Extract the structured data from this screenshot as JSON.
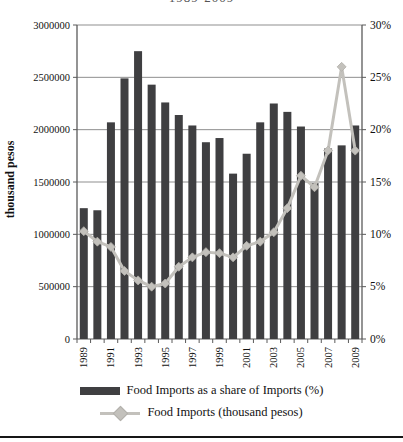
{
  "title_fragment": "1989-2009",
  "colors": {
    "bar": "#3f3f41",
    "line": "#c3c1bc",
    "line_edge": "#b2b0ab",
    "grid": "#8f8f8f",
    "axis": "#5a5a5a",
    "text": "#111111"
  },
  "y_axis_left_title": "thousand pesos",
  "chart_data": {
    "type": "bar",
    "subtype": "bar+line combo, dual axis",
    "categories": [
      1989,
      1990,
      1991,
      1992,
      1993,
      1994,
      1995,
      1996,
      1997,
      1998,
      1999,
      2000,
      2001,
      2002,
      2003,
      2004,
      2005,
      2006,
      2007,
      2008,
      2009
    ],
    "x_tick_labels": [
      "1989",
      "1991",
      "1993",
      "1995",
      "1997",
      "1999",
      "2001",
      "2003",
      "2005",
      "2007",
      "2009"
    ],
    "left_axis": {
      "label": "thousand pesos",
      "min": 0,
      "max": 3000000,
      "step": 500000,
      "tick_labels": [
        "0",
        "500000",
        "1000000",
        "1500000",
        "2000000",
        "2500000",
        "3000000"
      ]
    },
    "right_axis": {
      "min": 0,
      "max": 30,
      "step": 5,
      "tick_labels": [
        "0%",
        "5%",
        "10%",
        "15%",
        "20%",
        "25%",
        "30%"
      ]
    },
    "grid": true,
    "legend_position": "bottom",
    "series": [
      {
        "name": "Food Imports as a share of Imports (%)",
        "type": "bar",
        "axis": "left",
        "values": [
          1250000,
          1230000,
          2070000,
          2490000,
          2750000,
          2430000,
          2260000,
          2140000,
          2040000,
          1880000,
          1920000,
          1580000,
          1770000,
          2070000,
          2250000,
          2170000,
          2030000,
          1490000,
          1820000,
          1850000,
          2040000
        ]
      },
      {
        "name": "Food Imports (thousand pesos)",
        "type": "line",
        "marker": "diamond",
        "axis": "right",
        "values": [
          10.3,
          9.3,
          8.8,
          6.5,
          5.6,
          5.0,
          5.3,
          6.9,
          7.8,
          8.3,
          8.2,
          7.8,
          8.9,
          9.3,
          10.2,
          12.5,
          15.6,
          14.5,
          18.0,
          26.0,
          18.0
        ]
      }
    ]
  },
  "legend": {
    "bar_label": "Food Imports as a share of Imports (%)",
    "line_label": "Food Imports (thousand pesos)"
  }
}
